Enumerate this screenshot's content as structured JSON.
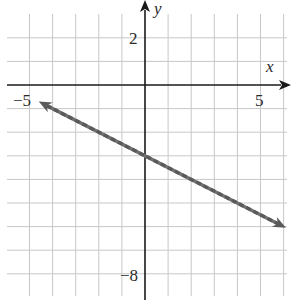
{
  "chart_data": {
    "type": "line",
    "title": "",
    "xlabel": "x",
    "ylabel": "y",
    "xlim": [
      -6,
      6
    ],
    "ylim": [
      -9,
      3
    ],
    "grid": true,
    "tick_labels": {
      "x": [
        {
          "value": -5,
          "label": "−5"
        },
        {
          "value": 5,
          "label": "5"
        }
      ],
      "y": [
        {
          "value": 2,
          "label": "2"
        },
        {
          "value": -8,
          "label": "−8"
        }
      ]
    },
    "series": [
      {
        "name": "line",
        "equation": "y = -0.5x - 3",
        "slope": -0.5,
        "intercept": -3,
        "style": "dashed",
        "arrows": "both",
        "x": [
          -4.6,
          6.1
        ],
        "y": [
          -0.7,
          -6.05
        ]
      }
    ]
  },
  "colors": {
    "grid": "#c8c8c8",
    "axis": "#1a1a1a",
    "line": "#707070",
    "line_dash": "#5a5a5a"
  },
  "labels": {
    "x_axis": "x",
    "y_axis": "y",
    "x_min_tick": "−5",
    "x_max_tick": "5",
    "y_top_tick": "2",
    "y_bottom_tick": "−8"
  }
}
